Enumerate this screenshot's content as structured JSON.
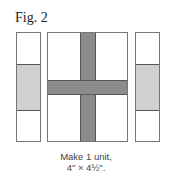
{
  "figure": {
    "title": "Fig. 2",
    "caption_line1": "Make 1 unit,",
    "caption_line2": "4\" × 4½\"."
  },
  "colors": {
    "light_fabric": "#d0d0d0",
    "dark_fabric": "#8c8c8c",
    "outline": "#777777"
  },
  "units": [
    {
      "name": "left-strip",
      "segments": [
        "white",
        "light",
        "white"
      ]
    },
    {
      "name": "center-block",
      "segments": [
        "white",
        "dark cross",
        "white"
      ]
    },
    {
      "name": "right-strip",
      "segments": [
        "white",
        "light",
        "white"
      ]
    }
  ]
}
